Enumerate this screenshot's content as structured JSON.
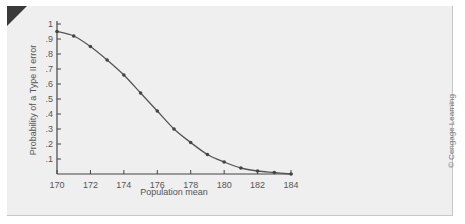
{
  "chart_data": {
    "type": "line",
    "title": "",
    "xlabel": "Population mean",
    "ylabel": "Probability of a Type II error",
    "x": [
      170,
      171,
      172,
      173,
      174,
      175,
      176,
      177,
      178,
      179,
      180,
      181,
      182,
      183,
      184
    ],
    "series": [
      {
        "name": "Type II error probability",
        "values": [
          0.95,
          0.92,
          0.85,
          0.76,
          0.66,
          0.54,
          0.42,
          0.3,
          0.21,
          0.13,
          0.08,
          0.04,
          0.02,
          0.01,
          0.0
        ]
      }
    ],
    "xticks": [
      "170",
      "172",
      "174",
      "176",
      "178",
      "180",
      "182",
      "184"
    ],
    "yticks": [
      ".1",
      ".2",
      ".3",
      ".4",
      ".5",
      ".6",
      ".7",
      ".8",
      ".9",
      "1"
    ],
    "xlim": [
      170,
      184
    ],
    "ylim": [
      0,
      1
    ],
    "grid": false,
    "legend": "none",
    "markers": true
  },
  "credit": "© Cengage Learning"
}
